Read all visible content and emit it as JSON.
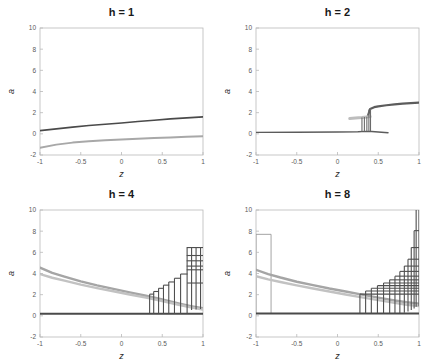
{
  "figure": {
    "width": 431,
    "height": 364,
    "background": "#ffffff",
    "layout": "2x2 grid of bifurcation diagrams"
  },
  "style": {
    "color_dark": "#4a4a4a",
    "color_mid": "#6f6f6f",
    "color_light": "#b0b0b0",
    "color_axis": "#b9b9b9",
    "color_tick_text": "#5a5a5a",
    "color_title": "#1a1a1a"
  },
  "chart_data": [
    {
      "type": "line",
      "panel": "top-left",
      "title": "h = 1",
      "xlabel": "z",
      "ylabel": "a",
      "xlim": [
        -1,
        1
      ],
      "ylim": [
        -2,
        10
      ],
      "xticks": [
        -1,
        -0.5,
        0,
        0.5,
        1
      ],
      "xticklabels": [
        "-1",
        "-0.5",
        "0",
        "0.5",
        "1"
      ],
      "yticks": [
        -2,
        0,
        2,
        4,
        6,
        8,
        10
      ],
      "yticklabels": [
        "-2",
        "0",
        "2",
        "4",
        "6",
        "8",
        "10"
      ],
      "grid": false,
      "legend": "none",
      "series": [
        {
          "name": "upper-branch",
          "color": "#4a4a4a",
          "width": 1.6,
          "x": [
            -1,
            -0.8,
            -0.6,
            -0.4,
            -0.2,
            0,
            0.2,
            0.4,
            0.6,
            0.8,
            1
          ],
          "values": [
            0.3,
            0.47,
            0.63,
            0.78,
            0.91,
            1.03,
            1.17,
            1.29,
            1.41,
            1.51,
            1.6
          ]
        },
        {
          "name": "lower-branch",
          "color": "#a8a8a8",
          "width": 2.0,
          "x": [
            -1,
            -0.8,
            -0.6,
            -0.4,
            -0.2,
            0,
            0.2,
            0.4,
            0.6,
            0.8,
            1
          ],
          "values": [
            -1.32,
            -1.02,
            -0.83,
            -0.7,
            -0.61,
            -0.53,
            -0.46,
            -0.4,
            -0.34,
            -0.28,
            -0.22
          ]
        }
      ]
    },
    {
      "type": "line",
      "panel": "top-right",
      "title": "h = 2",
      "xlabel": "z",
      "ylabel": "a",
      "xlim": [
        -1,
        1
      ],
      "ylim": [
        -2,
        10
      ],
      "xticks": [
        -1,
        -0.5,
        0,
        0.5,
        1
      ],
      "xticklabels": [
        "-1",
        "-0.5",
        "0",
        "0.5",
        "1"
      ],
      "yticks": [
        -2,
        0,
        2,
        4,
        6,
        8,
        10
      ],
      "yticklabels": [
        "-2",
        "0",
        "2",
        "4",
        "6",
        "8",
        "10"
      ],
      "grid": false,
      "legend": "none",
      "series": [
        {
          "name": "zero-baseline",
          "color": "#5c5c5c",
          "width": 1.4,
          "x": [
            -1,
            -0.5,
            0,
            0.25,
            0.35,
            0.42,
            0.5,
            0.62
          ],
          "values": [
            0.14,
            0.15,
            0.17,
            0.2,
            0.23,
            0.22,
            0.18,
            0.1
          ]
        },
        {
          "name": "upper-branch",
          "color": "#5c5c5c",
          "width": 2.2,
          "x": [
            0.37,
            0.4,
            0.45,
            0.5,
            0.6,
            0.7,
            0.8,
            0.9,
            1
          ],
          "values": [
            1.62,
            2.35,
            2.52,
            2.6,
            2.7,
            2.78,
            2.85,
            2.9,
            2.95
          ]
        },
        {
          "name": "ghost-band",
          "color": "#bdbdbd",
          "width": 3.0,
          "x": [
            0.15,
            0.22,
            0.3,
            0.36,
            0.4
          ],
          "values": [
            1.45,
            1.5,
            1.55,
            1.6,
            1.63
          ]
        }
      ],
      "vertical_jumps": [
        {
          "x": 0.3,
          "y0": 0.25,
          "y1": 1.55
        },
        {
          "x": 0.33,
          "y0": 0.25,
          "y1": 1.58
        },
        {
          "x": 0.36,
          "y0": 0.25,
          "y1": 1.62
        },
        {
          "x": 0.385,
          "y0": 0.25,
          "y1": 2.3
        },
        {
          "x": 0.405,
          "y0": 0.25,
          "y1": 2.4
        }
      ]
    },
    {
      "type": "line",
      "panel": "bottom-left",
      "title": "h = 4",
      "xlabel": "z",
      "ylabel": "a",
      "xlim": [
        -1,
        1
      ],
      "ylim": [
        -2,
        10
      ],
      "xticks": [
        -1,
        -0.5,
        0,
        0.5,
        1
      ],
      "xticklabels": [
        "-1",
        "-0.5",
        "0",
        "0.5",
        "1"
      ],
      "yticks": [
        -2,
        0,
        2,
        4,
        6,
        8,
        10
      ],
      "yticklabels": [
        "-2",
        "0",
        "2",
        "4",
        "6",
        "8",
        "10"
      ],
      "grid": false,
      "legend": "none",
      "series": [
        {
          "name": "zero-baseline",
          "color": "#4a4a4a",
          "width": 2.0,
          "x": [
            -1,
            -0.5,
            0,
            0.4,
            0.8,
            1
          ],
          "values": [
            0.2,
            0.2,
            0.2,
            0.2,
            0.2,
            0.2
          ]
        },
        {
          "name": "decaying-band-upper",
          "color": "#a5a5a5",
          "width": 2.4,
          "x": [
            -1,
            -0.85,
            -0.7,
            -0.5,
            -0.3,
            -0.1,
            0.1,
            0.3,
            0.5,
            0.7,
            0.85,
            1
          ],
          "values": [
            4.55,
            4.05,
            3.7,
            3.25,
            2.88,
            2.55,
            2.22,
            1.9,
            1.55,
            1.18,
            0.92,
            0.72
          ]
        },
        {
          "name": "decaying-band-lower",
          "color": "#c2c2c2",
          "width": 2.4,
          "x": [
            -1,
            -0.85,
            -0.7,
            -0.5,
            -0.3,
            -0.1,
            0.1,
            0.3,
            0.5,
            0.7,
            0.85,
            1
          ],
          "values": [
            3.95,
            3.6,
            3.32,
            2.95,
            2.62,
            2.32,
            2.02,
            1.72,
            1.4,
            1.05,
            0.8,
            0.6
          ]
        }
      ],
      "staircase": {
        "color": "#4f4f4f",
        "width": 1.1,
        "baseline": 0.2,
        "steps": [
          {
            "x0": 0.345,
            "x1": 0.4,
            "y": 2.05
          },
          {
            "x0": 0.395,
            "x1": 0.46,
            "y": 2.3
          },
          {
            "x0": 0.455,
            "x1": 0.52,
            "y": 2.6
          },
          {
            "x0": 0.515,
            "x1": 0.585,
            "y": 2.9
          },
          {
            "x0": 0.58,
            "x1": 0.655,
            "y": 3.2
          },
          {
            "x0": 0.65,
            "x1": 0.73,
            "y": 3.55
          },
          {
            "x0": 0.725,
            "x1": 0.81,
            "y": 3.95
          },
          {
            "x0": 0.805,
            "x1": 1.0,
            "y": 3.1
          },
          {
            "x0": 0.8,
            "x1": 1.0,
            "y": 4.35
          },
          {
            "x0": 0.8,
            "x1": 1.0,
            "y": 4.7
          },
          {
            "x0": 0.8,
            "x1": 1.0,
            "y": 5.2
          },
          {
            "x0": 0.8,
            "x1": 1.0,
            "y": 5.7
          },
          {
            "x0": 0.8,
            "x1": 1.0,
            "y": 6.45
          }
        ],
        "risers": [
          {
            "x": 0.345,
            "y0": 0.2,
            "y1": 2.05
          },
          {
            "x": 0.395,
            "y0": 0.2,
            "y1": 2.3
          },
          {
            "x": 0.455,
            "y0": 0.2,
            "y1": 2.6
          },
          {
            "x": 0.515,
            "y0": 0.2,
            "y1": 2.9
          },
          {
            "x": 0.58,
            "y0": 0.2,
            "y1": 3.2
          },
          {
            "x": 0.65,
            "y0": 0.2,
            "y1": 3.55
          },
          {
            "x": 0.725,
            "y0": 0.2,
            "y1": 3.95
          },
          {
            "x": 0.805,
            "y0": 0.2,
            "y1": 6.45
          },
          {
            "x": 0.86,
            "y0": 0.55,
            "y1": 6.45
          },
          {
            "x": 0.915,
            "y0": 0.6,
            "y1": 6.45
          },
          {
            "x": 0.97,
            "y0": 0.65,
            "y1": 6.45
          }
        ]
      }
    },
    {
      "type": "line",
      "panel": "bottom-right",
      "title": "h = 8",
      "xlabel": "z",
      "ylabel": "a",
      "xlim": [
        -1,
        1
      ],
      "ylim": [
        -2,
        10
      ],
      "xticks": [
        -1,
        -0.5,
        0,
        0.5,
        1
      ],
      "xticklabels": [
        "-1",
        "-0.5",
        "0",
        "0.5",
        "1"
      ],
      "yticks": [
        -2,
        0,
        2,
        4,
        6,
        8,
        10
      ],
      "yticklabels": [
        "-2",
        "0",
        "2",
        "4",
        "6",
        "8",
        "10"
      ],
      "grid": false,
      "legend": "none",
      "series": [
        {
          "name": "zero-baseline",
          "color": "#4a4a4a",
          "width": 2.0,
          "x": [
            -1,
            -0.5,
            0,
            0.4,
            0.8,
            1
          ],
          "values": [
            0.22,
            0.22,
            0.22,
            0.22,
            0.22,
            0.22
          ]
        },
        {
          "name": "decaying-band-upper",
          "color": "#a5a5a5",
          "width": 2.4,
          "x": [
            -1,
            -0.85,
            -0.7,
            -0.5,
            -0.3,
            -0.1,
            0.1,
            0.3,
            0.5,
            0.7,
            0.85,
            1
          ],
          "values": [
            4.35,
            3.95,
            3.62,
            3.22,
            2.9,
            2.58,
            2.3,
            2.0,
            1.72,
            1.45,
            1.28,
            1.15
          ]
        },
        {
          "name": "decaying-band-lower",
          "color": "#c2c2c2",
          "width": 2.4,
          "x": [
            -1,
            -0.85,
            -0.7,
            -0.5,
            -0.3,
            -0.1,
            0.1,
            0.3,
            0.5,
            0.7,
            0.85,
            1
          ],
          "values": [
            3.75,
            3.45,
            3.2,
            2.88,
            2.58,
            2.3,
            2.02,
            1.75,
            1.48,
            1.22,
            1.05,
            0.92
          ]
        }
      ],
      "left_spike": {
        "color": "#9a9a9a",
        "width": 0.9,
        "x0": -1.0,
        "x1": -0.815,
        "y_top": 7.7,
        "y_base": 0.22
      },
      "staircase": {
        "color": "#4f4f4f",
        "width": 1.1,
        "baseline": 0.22,
        "steps": [
          {
            "x0": 0.275,
            "x1": 1.0,
            "y": 2.05
          },
          {
            "x0": 0.345,
            "x1": 1.0,
            "y": 2.35
          },
          {
            "x0": 0.415,
            "x1": 1.0,
            "y": 2.6
          },
          {
            "x0": 0.49,
            "x1": 1.0,
            "y": 2.85
          },
          {
            "x0": 0.565,
            "x1": 1.0,
            "y": 3.1
          },
          {
            "x0": 0.64,
            "x1": 1.0,
            "y": 3.4
          },
          {
            "x0": 0.705,
            "x1": 1.0,
            "y": 3.75
          },
          {
            "x0": 0.765,
            "x1": 1.0,
            "y": 4.2
          },
          {
            "x0": 0.82,
            "x1": 1.0,
            "y": 4.7
          },
          {
            "x0": 0.865,
            "x1": 1.0,
            "y": 5.35
          },
          {
            "x0": 0.905,
            "x1": 1.0,
            "y": 6.45
          },
          {
            "x0": 0.94,
            "x1": 1.0,
            "y": 8.05
          },
          {
            "x0": 0.965,
            "x1": 1.0,
            "y": 10.3
          }
        ],
        "risers": [
          {
            "x": 0.275,
            "y0": 0.22,
            "y1": 2.05
          },
          {
            "x": 0.345,
            "y0": 0.22,
            "y1": 2.35
          },
          {
            "x": 0.415,
            "y0": 0.22,
            "y1": 2.6
          },
          {
            "x": 0.49,
            "y0": 0.22,
            "y1": 2.85
          },
          {
            "x": 0.565,
            "y0": 0.22,
            "y1": 3.1
          },
          {
            "x": 0.64,
            "y0": 0.22,
            "y1": 3.4
          },
          {
            "x": 0.705,
            "y0": 0.22,
            "y1": 3.75
          },
          {
            "x": 0.765,
            "y0": 0.22,
            "y1": 4.2
          },
          {
            "x": 0.82,
            "y0": 0.3,
            "y1": 4.7
          },
          {
            "x": 0.865,
            "y0": 0.4,
            "y1": 5.35
          },
          {
            "x": 0.905,
            "y0": 0.55,
            "y1": 6.45
          },
          {
            "x": 0.94,
            "y0": 0.7,
            "y1": 8.05
          },
          {
            "x": 0.965,
            "y0": 0.85,
            "y1": 10.3
          },
          {
            "x": 1.0,
            "y0": 0.9,
            "y1": 10.3
          }
        ]
      }
    }
  ]
}
